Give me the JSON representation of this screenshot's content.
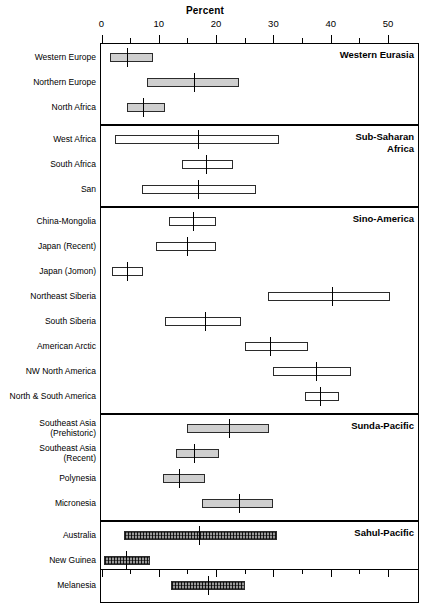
{
  "chart_data": {
    "type": "bar",
    "orientation": "horizontal",
    "title": "",
    "xlabel": "Percent",
    "ylabel": "",
    "xlim": [
      0,
      55
    ],
    "grid": false,
    "legend": null,
    "x_major_ticks": [
      0,
      10,
      20,
      30,
      40,
      50
    ],
    "x_minor_ticks": [
      5,
      15,
      25,
      35,
      45
    ],
    "x_tick_labels": [
      "0",
      "10",
      "20",
      "30",
      "40",
      "50"
    ],
    "encoding": "Each row is a horizontal range bar (low-high) with a vertical tick marking the mean value.",
    "panels": [
      {
        "name": "Western Eurasia",
        "rows": [
          {
            "label": "Western Europe",
            "low": 1.5,
            "high": 9.0,
            "mean": 4.4,
            "fill": "grey"
          },
          {
            "label": "Northern Europe",
            "low": 8.0,
            "high": 24.0,
            "mean": 16.2,
            "fill": "grey"
          },
          {
            "label": "North Africa",
            "low": 4.5,
            "high": 11.0,
            "mean": 7.3,
            "fill": "grey"
          }
        ]
      },
      {
        "name": "Sub-Saharan Africa",
        "rows": [
          {
            "label": "West Africa",
            "low": 2.4,
            "high": 31.0,
            "mean": 16.9,
            "fill": "white"
          },
          {
            "label": "South Africa",
            "low": 14.0,
            "high": 23.0,
            "mean": 18.2,
            "fill": "white"
          },
          {
            "label": "San",
            "low": 7.0,
            "high": 27.0,
            "mean": 16.9,
            "fill": "white"
          }
        ]
      },
      {
        "name": "Sino-America",
        "rows": [
          {
            "label": "China-Mongolia",
            "low": 11.7,
            "high": 20.0,
            "mean": 15.9,
            "fill": "white"
          },
          {
            "label": "Japan (Recent)",
            "low": 9.5,
            "high": 20.0,
            "mean": 15.0,
            "fill": "white"
          },
          {
            "label": "Japan (Jomon)",
            "low": 1.8,
            "high": 7.3,
            "mean": 4.5,
            "fill": "white"
          },
          {
            "label": "Northeast Siberia",
            "low": 29.0,
            "high": 50.3,
            "mean": 40.2,
            "fill": "white"
          },
          {
            "label": "South Siberia",
            "low": 11.0,
            "high": 24.4,
            "mean": 18.0,
            "fill": "white"
          },
          {
            "label": "American Arctic",
            "low": 25.0,
            "high": 36.0,
            "mean": 29.4,
            "fill": "white"
          },
          {
            "label": "NW North America",
            "low": 30.0,
            "high": 43.5,
            "mean": 37.5,
            "fill": "white"
          },
          {
            "label": "North & South America",
            "low": 35.5,
            "high": 41.5,
            "mean": 38.2,
            "fill": "white"
          }
        ]
      },
      {
        "name": "Sunda-Pacific",
        "rows": [
          {
            "label": "Southeast Asia\n(Prehistoric)",
            "low": 15.0,
            "high": 29.3,
            "mean": 22.2,
            "fill": "grey"
          },
          {
            "label": "Southeast Asia\n(Recent)",
            "low": 13.0,
            "high": 20.5,
            "mean": 16.2,
            "fill": "grey"
          },
          {
            "label": "Polynesia",
            "low": 10.8,
            "high": 18.0,
            "mean": 13.6,
            "fill": "grey"
          },
          {
            "label": "Micronesia",
            "low": 17.5,
            "high": 30.0,
            "mean": 24.0,
            "fill": "grey"
          }
        ]
      },
      {
        "name": "Sahul-Pacific",
        "rows": [
          {
            "label": "Australia",
            "low": 4.0,
            "high": 30.6,
            "mean": 17.1,
            "fill": "hatch"
          },
          {
            "label": "New Guinea",
            "low": 0.4,
            "high": 8.4,
            "mean": 4.2,
            "fill": "hatch"
          },
          {
            "label": "Melanesia",
            "low": 12.2,
            "high": 25.0,
            "mean": 18.5,
            "fill": "hatch"
          }
        ]
      }
    ]
  },
  "colors": {
    "axis": "#000000",
    "box_outline": "#2b2b2b",
    "fill_grey": "#cfcfcf",
    "fill_white": "#ffffff",
    "fill_hatch": "#9a9a9a",
    "background": "#ffffff"
  }
}
